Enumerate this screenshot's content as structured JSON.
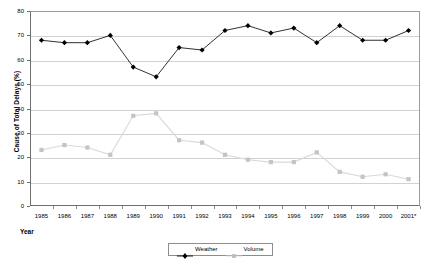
{
  "chart_data": {
    "type": "line",
    "title": "",
    "xlabel": "Year",
    "ylabel": "Cause of Total Delays (%)",
    "categories": [
      "1985",
      "1986",
      "1987",
      "1988",
      "1989",
      "1990",
      "1991",
      "1992",
      "1993",
      "1994",
      "1995",
      "1996",
      "1997",
      "1998",
      "1999",
      "2000",
      "2001*"
    ],
    "ylim": [
      0,
      80
    ],
    "y_ticks": [
      0,
      10,
      20,
      30,
      40,
      50,
      60,
      70,
      80
    ],
    "grid": true,
    "legend_position": "bottom-center",
    "series": [
      {
        "name": "Weather",
        "color": "#000000",
        "marker": "diamond",
        "values": [
          68,
          67,
          67,
          70,
          57,
          53,
          65,
          64,
          72,
          74,
          71,
          73,
          67,
          74,
          68,
          68,
          72
        ]
      },
      {
        "name": "Volume",
        "color": "#c0c0c0",
        "marker": "square",
        "values": [
          23,
          25,
          24,
          21,
          37,
          38,
          27,
          26,
          21,
          19,
          18,
          18,
          22,
          14,
          12,
          13,
          11
        ]
      }
    ]
  },
  "legend": {
    "entries": [
      {
        "label": "Weather"
      },
      {
        "label": "Volume"
      }
    ]
  }
}
